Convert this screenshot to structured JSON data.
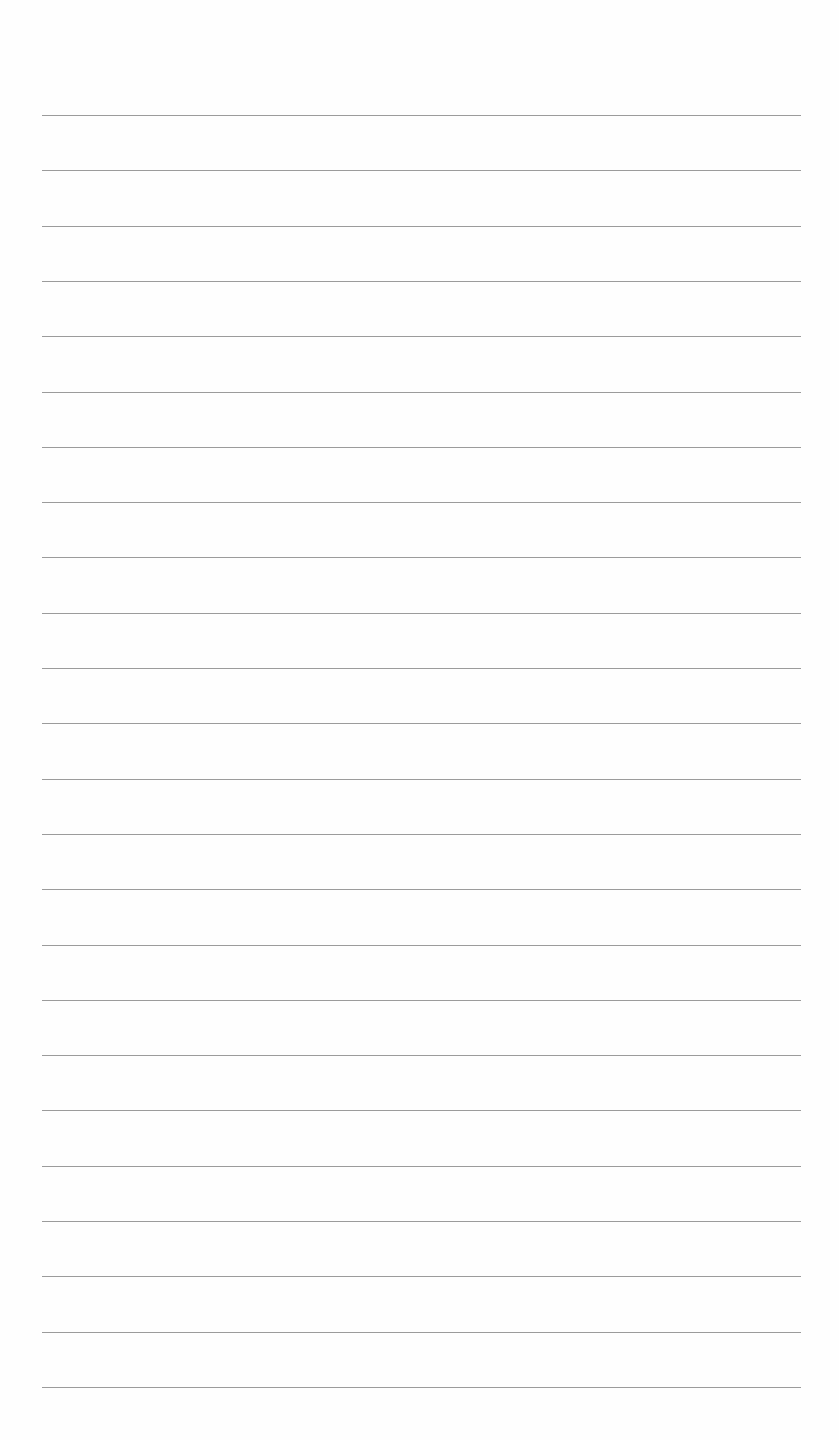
{
  "document": {
    "type": "lined-paper",
    "text_content": "",
    "rules": {
      "count": 24,
      "first_y": 115,
      "spacing": 55.3,
      "left_x": 42,
      "right_x": 801,
      "color": "#8a8a8a"
    },
    "background_color": "#fefefe"
  }
}
